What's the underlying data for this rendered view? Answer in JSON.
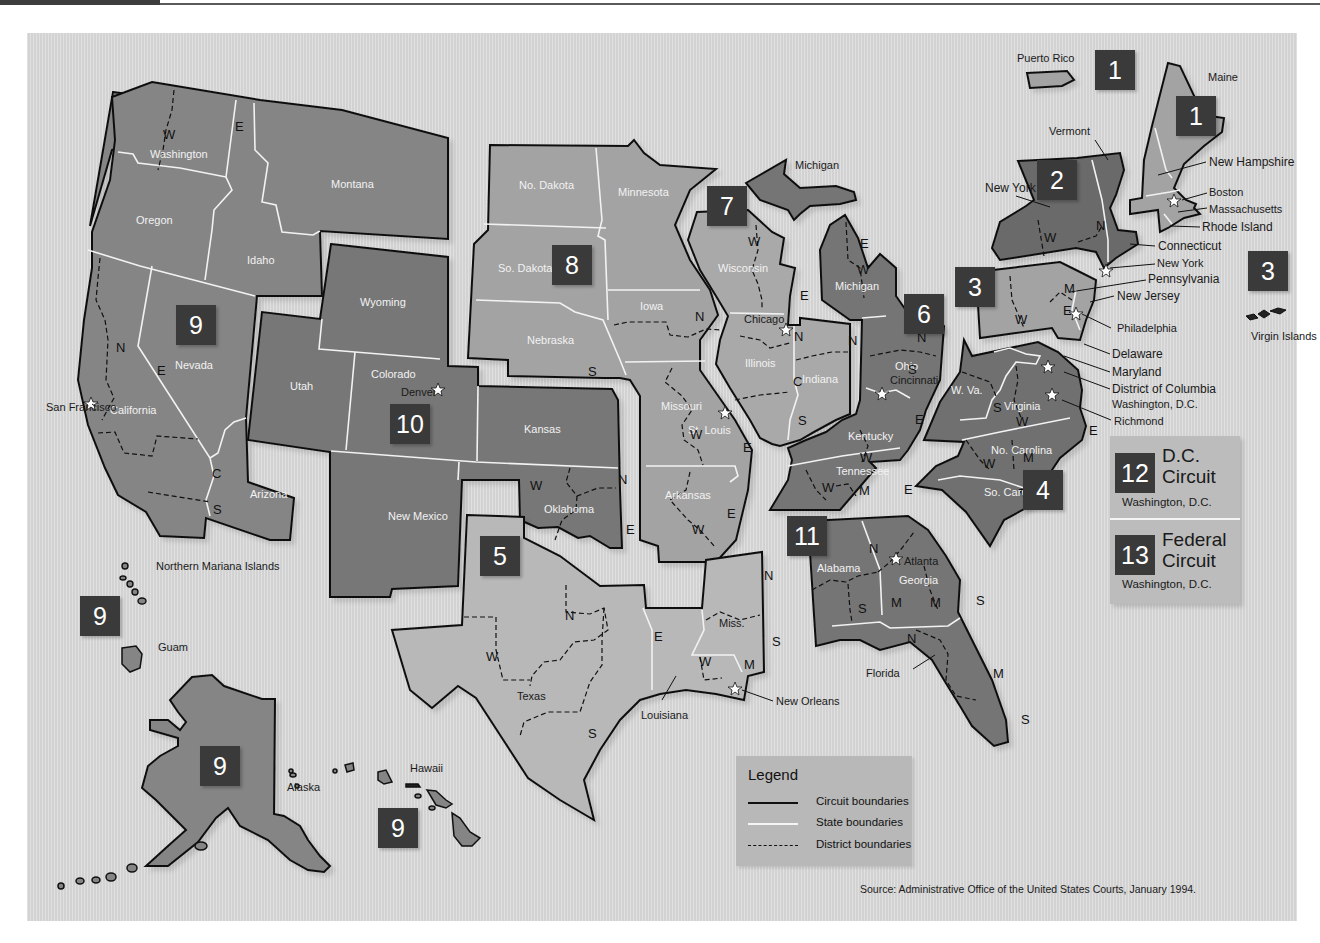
{
  "header": {
    "bar_color": "#3d3d3d"
  },
  "map": {
    "title": "Geographic Boundaries of United States Courts of Appeals and District Courts",
    "colors": {
      "background": "#d9d9d9",
      "circuit_dark": "#6e6e6e",
      "circuit_mid": "#848484",
      "circuit_light": "#a6a6a6",
      "circuit_lighter": "#b5b5b5",
      "number_box": "#3a3a3a"
    },
    "circuits": [
      {
        "number": "1",
        "states": [
          "Maine",
          "New Hampshire",
          "Massachusetts",
          "Rhode Island",
          "Puerto Rico"
        ]
      },
      {
        "number": "2",
        "states": [
          "Vermont",
          "New York",
          "Connecticut"
        ]
      },
      {
        "number": "3",
        "states": [
          "Pennsylvania",
          "New Jersey",
          "Delaware",
          "Virgin Islands"
        ]
      },
      {
        "number": "4",
        "states": [
          "Maryland",
          "W. Va.",
          "Virginia",
          "No. Carolina",
          "So. Carolina"
        ]
      },
      {
        "number": "5",
        "states": [
          "Texas",
          "Louisiana",
          "Miss."
        ]
      },
      {
        "number": "6",
        "states": [
          "Michigan",
          "Ohio",
          "Kentucky",
          "Tennessee"
        ]
      },
      {
        "number": "7",
        "states": [
          "Wisconsin",
          "Illinois",
          "Indiana"
        ]
      },
      {
        "number": "8",
        "states": [
          "No. Dakota",
          "So. Dakota",
          "Nebraska",
          "Minnesota",
          "Iowa",
          "Missouri",
          "Arkansas"
        ]
      },
      {
        "number": "9",
        "states": [
          "Washington",
          "Oregon",
          "California",
          "Nevada",
          "Idaho",
          "Montana",
          "Arizona",
          "Alaska",
          "Hawaii",
          "Guam",
          "Northern Mariana Islands"
        ]
      },
      {
        "number": "10",
        "states": [
          "Wyoming",
          "Utah",
          "Colorado",
          "Kansas",
          "New Mexico",
          "Oklahoma"
        ]
      },
      {
        "number": "11",
        "states": [
          "Alabama",
          "Georgia",
          "Florida"
        ]
      }
    ],
    "state_labels": {
      "washington": "Washington",
      "oregon": "Oregon",
      "idaho": "Idaho",
      "montana": "Montana",
      "nevada": "Nevada",
      "california": "California",
      "arizona": "Arizona",
      "wyoming": "Wyoming",
      "utah": "Utah",
      "colorado": "Colorado",
      "kansas": "Kansas",
      "new_mexico": "New Mexico",
      "oklahoma": "Oklahoma",
      "no_dakota": "No. Dakota",
      "so_dakota": "So. Dakota",
      "nebraska": "Nebraska",
      "minnesota": "Minnesota",
      "iowa": "Iowa",
      "missouri": "Missouri",
      "arkansas": "Arkansas",
      "wisconsin": "Wisconsin",
      "illinois": "Illinois",
      "indiana": "Indiana",
      "michigan": "Michigan",
      "michigan_up": "Michigan",
      "ohio": "Ohio",
      "kentucky": "Kentucky",
      "tennessee": "Tennessee",
      "texas": "Texas",
      "louisiana": "Louisiana",
      "miss": "Miss.",
      "alabama": "Alabama",
      "georgia": "Georgia",
      "florida": "Florida",
      "w_va": "W. Va.",
      "virginia": "Virginia",
      "no_carolina": "No. Carolina",
      "so_carolina": "So. Carolina",
      "maryland": "Maryland",
      "delaware": "Delaware",
      "dc": "District of Columbia",
      "pennsylvania": "Pennsylvania",
      "new_jersey": "New Jersey",
      "new_york": "New York",
      "vermont": "Vermont",
      "connecticut": "Connecticut",
      "maine": "Maine",
      "new_hampshire": "New Hampshire",
      "massachusetts": "Massachusetts",
      "rhode_island": "Rhode Island",
      "puerto_rico": "Puerto Rico",
      "virgin_islands": "Virgin Islands",
      "alaska": "Alaska",
      "hawaii": "Hawaii",
      "guam": "Guam",
      "northern_mariana": "Northern Mariana Islands"
    },
    "cities": {
      "san_francisco": "San Francisco",
      "denver": "Denver",
      "st_louis": "St. Louis",
      "chicago": "Chicago",
      "cincinnati": "Cincinnati",
      "new_orleans": "New Orleans",
      "atlanta": "Atlanta",
      "richmond": "Richmond",
      "washington_dc": "Washington, D.C.",
      "philadelphia": "Philadelphia",
      "new_york": "New York",
      "boston": "Boston"
    },
    "circuit_boxes": [
      {
        "id": "c1-pr",
        "number": "1"
      },
      {
        "id": "c1-me",
        "number": "1"
      },
      {
        "id": "c2",
        "number": "2"
      },
      {
        "id": "c3",
        "number": "3"
      },
      {
        "id": "c3-vi",
        "number": "3"
      },
      {
        "id": "c4",
        "number": "4"
      },
      {
        "id": "c5",
        "number": "5"
      },
      {
        "id": "c6",
        "number": "6"
      },
      {
        "id": "c7",
        "number": "7"
      },
      {
        "id": "c8",
        "number": "8"
      },
      {
        "id": "c9",
        "number": "9"
      },
      {
        "id": "c9-guam",
        "number": "9"
      },
      {
        "id": "c9-ak",
        "number": "9"
      },
      {
        "id": "c9-hi",
        "number": "9"
      },
      {
        "id": "c10",
        "number": "10"
      },
      {
        "id": "c11",
        "number": "11"
      }
    ],
    "dc_circuits": [
      {
        "number": "12",
        "title_line1": "D.C.",
        "title_line2": "Circuit",
        "location": "Washington, D.C."
      },
      {
        "number": "13",
        "title_line1": "Federal",
        "title_line2": "Circuit",
        "location": "Washington, D.C."
      }
    ],
    "legend": {
      "title": "Legend",
      "items": [
        {
          "label": "Circuit boundaries",
          "style": "solid-black"
        },
        {
          "label": "State boundaries",
          "style": "solid-white"
        },
        {
          "label": "District boundaries",
          "style": "dashed-black"
        }
      ]
    },
    "source": "Source: Administrative Office of the United States Courts, January 1994."
  }
}
